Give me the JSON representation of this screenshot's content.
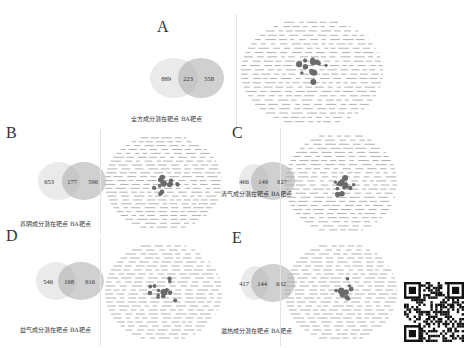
{
  "figure": {
    "panels": [
      {
        "id": "A",
        "label": "A",
        "venn": {
          "left_only": "889",
          "overlap": "223",
          "right_only": "558"
        },
        "caption": "全方成分潜在靶点 BA靶点",
        "sets": [
          "全方成分潜在靶点",
          "BA靶点"
        ]
      },
      {
        "id": "B",
        "label": "B",
        "venn": {
          "left_only": "653",
          "overlap": "177",
          "right_only": "596"
        },
        "caption": "养阴成分潜在靶点 BA靶点",
        "sets": [
          "养阴成分潜在靶点",
          "BA靶点"
        ]
      },
      {
        "id": "C",
        "label": "C",
        "venn": {
          "left_only": "466",
          "overlap": "149",
          "right_only": "627"
        },
        "caption": "清气成分潜在靶点 BA靶点",
        "sets": [
          "清气成分潜在靶点",
          "BA靶点"
        ]
      },
      {
        "id": "D",
        "label": "D",
        "venn": {
          "left_only": "546",
          "overlap": "168",
          "right_only": "616"
        },
        "caption": "益气成分潜在靶点 BA靶点",
        "sets": [
          "益气成分潜在靶点",
          "BA靶点"
        ]
      },
      {
        "id": "E",
        "label": "E",
        "venn": {
          "left_only": "417",
          "overlap": "144",
          "right_only": "632"
        },
        "caption": "滋热成分潜在靶点 BA靶点",
        "sets": [
          "滋热成分潜在靶点",
          "BA靶点"
        ]
      }
    ],
    "qr_code": {
      "icon": "qr-code-icon"
    },
    "colors": {
      "venn_left": "#e6e6e6",
      "venn_right": "#bdbdbd",
      "node_dark": "#666666",
      "label_gray": "#9a9a9a"
    }
  }
}
